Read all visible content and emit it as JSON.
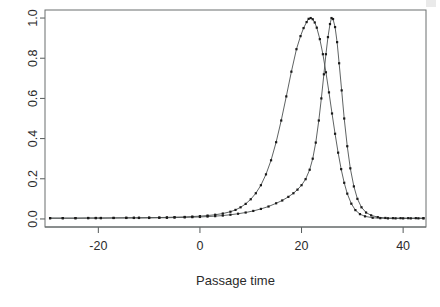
{
  "chart_data": {
    "type": "line",
    "title": "",
    "subtitle": "",
    "xlabel": "Passage time",
    "ylabel": "",
    "xlim": [
      -30.5,
      44.5
    ],
    "ylim": [
      -0.04,
      1.04
    ],
    "xticks": [
      -20,
      0,
      20,
      40
    ],
    "xtick_labels": [
      "-20",
      "0",
      "20",
      "40"
    ],
    "yticks": [
      0.0,
      0.2,
      0.4,
      0.6,
      0.8,
      1.0
    ],
    "ytick_labels": [
      "0.0",
      "0.2",
      "0.4",
      "0.6",
      "0.8",
      "1.0"
    ],
    "grid": false,
    "legend": "none",
    "box": true,
    "markers": "points",
    "marker_style": "filled-square",
    "series": [
      {
        "name": "broad-curve",
        "peak_x": 21.4,
        "peak_y": 1.0,
        "x": [
          -29.5,
          -27.0,
          -24.5,
          -22.0,
          -20.5,
          -19.5,
          -17.0,
          -14.5,
          -13.0,
          -12.0,
          -10.0,
          -8.0,
          -6.5,
          -5.0,
          -3.0,
          -1.5,
          0.0,
          1.5,
          3.0,
          4.5,
          6.0,
          7.0,
          8.0,
          9.0,
          10.0,
          11.0,
          12.0,
          13.0,
          14.0,
          15.0,
          16.0,
          17.0,
          18.0,
          19.0,
          19.8,
          20.4,
          21.0,
          21.4,
          21.8,
          22.2,
          22.6,
          23.0,
          23.6,
          24.2,
          24.8,
          25.4,
          26.0,
          26.6,
          27.2,
          27.8,
          28.4,
          29.0,
          29.8,
          30.6,
          31.5,
          32.5,
          34.0,
          35.5,
          37.0,
          38.5,
          40.0,
          41.5,
          43.0,
          44.0
        ],
        "y": [
          0.004,
          0.004,
          0.004,
          0.005,
          0.005,
          0.005,
          0.005,
          0.006,
          0.006,
          0.006,
          0.007,
          0.007,
          0.008,
          0.009,
          0.01,
          0.012,
          0.014,
          0.017,
          0.021,
          0.027,
          0.036,
          0.045,
          0.058,
          0.075,
          0.098,
          0.128,
          0.168,
          0.222,
          0.292,
          0.382,
          0.49,
          0.61,
          0.733,
          0.845,
          0.91,
          0.95,
          0.98,
          0.996,
          1.0,
          0.994,
          0.978,
          0.952,
          0.895,
          0.82,
          0.73,
          0.63,
          0.525,
          0.424,
          0.33,
          0.248,
          0.18,
          0.126,
          0.076,
          0.044,
          0.024,
          0.013,
          0.006,
          0.004,
          0.003,
          0.003,
          0.003,
          0.003,
          0.003,
          0.003
        ]
      },
      {
        "name": "narrow-curve",
        "peak_x": 25.9,
        "peak_y": 1.0,
        "x": [
          -29.5,
          -27.0,
          -24.5,
          -22.0,
          -20.5,
          -19.5,
          -17.0,
          -14.5,
          -13.0,
          -12.0,
          -10.0,
          -8.0,
          -6.5,
          -5.0,
          -3.0,
          -1.5,
          0.0,
          1.5,
          3.0,
          4.5,
          6.0,
          7.5,
          9.0,
          10.5,
          12.0,
          13.5,
          15.0,
          16.2,
          17.4,
          18.4,
          19.2,
          20.0,
          20.8,
          21.6,
          22.2,
          22.8,
          23.4,
          23.9,
          24.4,
          24.8,
          25.2,
          25.6,
          25.9,
          26.2,
          26.6,
          27.0,
          27.4,
          27.9,
          28.4,
          29.0,
          29.6,
          30.3,
          31.0,
          31.8,
          32.7,
          33.7,
          35.0,
          36.5,
          38.0,
          39.5,
          41.0,
          42.5,
          44.0
        ],
        "y": [
          0.004,
          0.004,
          0.004,
          0.004,
          0.004,
          0.004,
          0.005,
          0.005,
          0.005,
          0.005,
          0.005,
          0.006,
          0.006,
          0.007,
          0.008,
          0.009,
          0.01,
          0.012,
          0.014,
          0.017,
          0.021,
          0.026,
          0.032,
          0.04,
          0.05,
          0.062,
          0.078,
          0.092,
          0.11,
          0.128,
          0.146,
          0.168,
          0.198,
          0.245,
          0.3,
          0.38,
          0.49,
          0.6,
          0.72,
          0.82,
          0.905,
          0.97,
          1.0,
          0.995,
          0.955,
          0.88,
          0.775,
          0.64,
          0.5,
          0.362,
          0.252,
          0.162,
          0.1,
          0.058,
          0.032,
          0.018,
          0.009,
          0.005,
          0.004,
          0.004,
          0.004,
          0.004,
          0.004
        ]
      }
    ]
  }
}
